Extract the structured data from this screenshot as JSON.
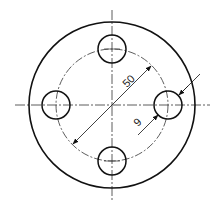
{
  "drawing": {
    "title": "Flange with 4 bolt holes",
    "center": [
      112,
      105
    ],
    "outer_radius": 83,
    "bolt_circle_radius": 56,
    "hole_radius": 14,
    "stroke_color": "#111111",
    "dims": {
      "bolt_circle_diameter": "50",
      "hole_diameter": "9"
    }
  }
}
